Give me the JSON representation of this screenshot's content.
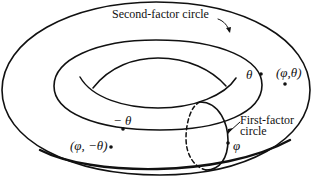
{
  "diagram": {
    "type": "torus-product-of-circles",
    "colors": {
      "stroke": "#111111",
      "background": "#ffffff"
    },
    "labels": {
      "second_factor": "Second-factor circle",
      "first_factor_line1": "First-factor",
      "first_factor_line2": "circle",
      "theta": "θ",
      "neg_theta": "− θ",
      "phi": "φ",
      "point_phi_theta": "(φ,θ)",
      "point_phi_neg_theta": "(φ, −θ)"
    }
  }
}
